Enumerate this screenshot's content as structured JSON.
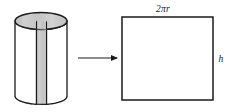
{
  "figure": {
    "name": "cylinder-unrolled-into-rectangle",
    "background_color": "#ffffff",
    "stroke_color": "#1a1a1a",
    "shade_color": "#c9c9c9"
  },
  "cylinder": {
    "label": "cylinder",
    "top_face": "shaded-ellipse",
    "cut_strip": "shaded-vertical-band",
    "hidden_edge_style": "dashed",
    "geometry": {
      "center_x": 41,
      "top_y": 21,
      "bottom_y": 96,
      "radius_x": 26,
      "radius_y": 8.5
    }
  },
  "arrow": {
    "name": "transform-arrow",
    "direction": "right",
    "x_start": 78,
    "x_end": 118,
    "y": 58
  },
  "rectangle": {
    "name": "unrolled-lateral-surface",
    "fill": "#ffffff",
    "geometry": {
      "x": 122,
      "y": 17,
      "width": 91,
      "height": 83
    },
    "labels": {
      "width_label": "2πr",
      "width_label_parts": {
        "coefficient": "2",
        "pi": "π",
        "radius": "r"
      },
      "height_label": "h"
    }
  }
}
